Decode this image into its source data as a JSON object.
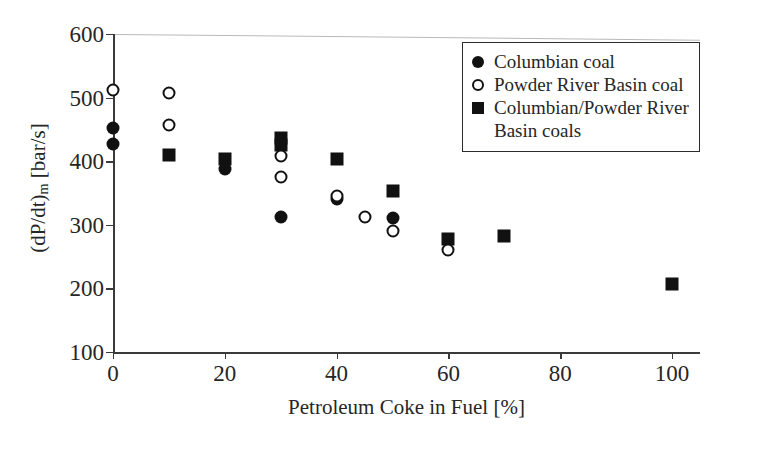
{
  "figure": {
    "background": "#ffffff",
    "ink_color": "#1a1a1a"
  },
  "chart_data": {
    "type": "scatter",
    "title": "",
    "xlabel": "Petroleum Coke in Fuel [%]",
    "ylabel": "(dP/dt)m [bar/s]",
    "ylabel_parts": {
      "base_open": "(dP/dt)",
      "subscript": "m",
      "unit": " [bar/s]"
    },
    "xlim": [
      0,
      105
    ],
    "ylim": [
      100,
      600
    ],
    "xticks": [
      0,
      20,
      40,
      60,
      80,
      100
    ],
    "yticks": [
      100,
      200,
      300,
      400,
      500,
      600
    ],
    "xtick_labels": [
      "0",
      "20",
      "40",
      "60",
      "80",
      "100"
    ],
    "ytick_labels": [
      "100",
      "200",
      "300",
      "400",
      "500",
      "600"
    ],
    "grid": false,
    "legend_position": "upper right",
    "series": [
      {
        "name": "Columbian coal",
        "marker": "filled-circle",
        "color": "#111111",
        "points": [
          {
            "x": 0,
            "y": 452
          },
          {
            "x": 0,
            "y": 427
          },
          {
            "x": 20,
            "y": 388
          },
          {
            "x": 30,
            "y": 312
          },
          {
            "x": 40,
            "y": 340
          },
          {
            "x": 50,
            "y": 310
          }
        ]
      },
      {
        "name": "Powder River Basin coal",
        "marker": "open-circle",
        "color": "#111111",
        "points": [
          {
            "x": 0,
            "y": 512
          },
          {
            "x": 10,
            "y": 508
          },
          {
            "x": 10,
            "y": 457
          },
          {
            "x": 30,
            "y": 408
          },
          {
            "x": 30,
            "y": 375
          },
          {
            "x": 40,
            "y": 345
          },
          {
            "x": 45,
            "y": 312
          },
          {
            "x": 50,
            "y": 290
          },
          {
            "x": 60,
            "y": 261
          }
        ]
      },
      {
        "name": "Columbian/Powder River Basin coals",
        "marker": "filled-square",
        "color": "#111111",
        "points": [
          {
            "x": 10,
            "y": 409
          },
          {
            "x": 20,
            "y": 403
          },
          {
            "x": 30,
            "y": 437
          },
          {
            "x": 30,
            "y": 425
          },
          {
            "x": 40,
            "y": 403
          },
          {
            "x": 50,
            "y": 353
          },
          {
            "x": 60,
            "y": 277
          },
          {
            "x": 70,
            "y": 282
          },
          {
            "x": 100,
            "y": 207
          }
        ]
      }
    ]
  },
  "legend": {
    "entries": [
      {
        "marker": "filled-circle",
        "label": "Columbian coal",
        "label_cont": ""
      },
      {
        "marker": "open-circle",
        "label": "Powder River Basin coal",
        "label_cont": ""
      },
      {
        "marker": "filled-square",
        "label": "Columbian/Powder River",
        "label_cont": "Basin coals"
      }
    ]
  }
}
